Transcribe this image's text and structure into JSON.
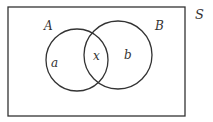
{
  "diagram": {
    "type": "venn",
    "universe": {
      "label": "S",
      "label_pos": [
        201,
        18
      ],
      "rect": {
        "x": 8,
        "y": 7,
        "width": 177,
        "height": 109
      }
    },
    "sets": [
      {
        "name": "A",
        "label": "A",
        "label_pos": [
          49,
          29
        ],
        "circle": {
          "cx": 77,
          "cy": 60,
          "r": 31
        }
      },
      {
        "name": "B",
        "label": "B",
        "label_pos": [
          160,
          29
        ],
        "circle": {
          "cx": 118,
          "cy": 55,
          "r": 34
        }
      }
    ],
    "regions": [
      {
        "name": "only-A",
        "label": "a",
        "label_pos": [
          54,
          67
        ]
      },
      {
        "name": "intersection",
        "label": "x",
        "label_pos": [
          96,
          59
        ]
      },
      {
        "name": "only-B",
        "label": "b",
        "label_pos": [
          127,
          58
        ]
      }
    ],
    "colors": {
      "stroke": "#333333",
      "text": "#333333",
      "background": "#ffffff"
    }
  }
}
